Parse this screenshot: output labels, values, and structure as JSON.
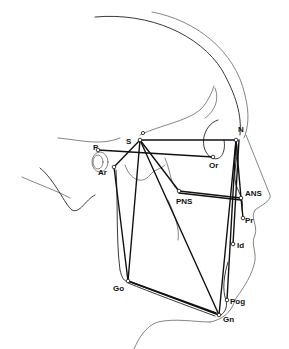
{
  "figure": {
    "type": "cephalometric tracing (lateral skull profile)",
    "landmarks": [
      {
        "id": "S",
        "label": "S",
        "x": 140,
        "y": 140,
        "lx": 126,
        "ly": 144
      },
      {
        "id": "N",
        "label": "N",
        "x": 236,
        "y": 140,
        "lx": 238,
        "ly": 132
      },
      {
        "id": "Or",
        "label": "Or",
        "x": 213,
        "y": 157,
        "lx": 209,
        "ly": 166
      },
      {
        "id": "P",
        "label": "P",
        "x": 98,
        "y": 150,
        "lx": 93,
        "ly": 150
      },
      {
        "id": "Ar",
        "label": "Ar",
        "x": 114,
        "y": 167,
        "lx": 100,
        "ly": 174
      },
      {
        "id": "PNS",
        "label": "PNS",
        "x": 179,
        "y": 191,
        "lx": 178,
        "ly": 204
      },
      {
        "id": "ANS",
        "label": "ANS",
        "x": 241,
        "y": 198,
        "lx": 244,
        "ly": 196
      },
      {
        "id": "Pr",
        "label": "Pr",
        "x": 243,
        "y": 218,
        "lx": 244,
        "ly": 223
      },
      {
        "id": "Id",
        "label": "Id",
        "x": 233,
        "y": 244,
        "lx": 236,
        "ly": 248
      },
      {
        "id": "Go",
        "label": "Go",
        "x": 128,
        "y": 281,
        "lx": 114,
        "ly": 291
      },
      {
        "id": "Pog",
        "label": "Pog",
        "x": 227,
        "y": 300,
        "lx": 230,
        "ly": 304
      },
      {
        "id": "Gn",
        "label": "Gn",
        "x": 219,
        "y": 315,
        "lx": 223,
        "ly": 322
      }
    ],
    "lines": [
      [
        "P",
        "Or"
      ],
      [
        "S",
        "N"
      ],
      [
        "S",
        "Ar"
      ],
      [
        "S",
        "Go"
      ],
      [
        "S",
        "Gn"
      ],
      [
        "S",
        "PNS"
      ],
      [
        "N",
        "Gn"
      ],
      [
        "N",
        "Pog"
      ],
      [
        "N",
        "ANS"
      ],
      [
        "N",
        "Id"
      ],
      [
        "PNS",
        "ANS"
      ],
      [
        "Go",
        "Gn"
      ],
      [
        "Go",
        "Pog"
      ],
      [
        "Ar",
        "Go"
      ]
    ]
  }
}
